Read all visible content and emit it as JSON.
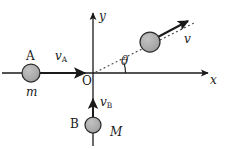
{
  "figure": {
    "type": "physics-vector-diagram",
    "background_color": "#ffffff",
    "line_color": "#1a1a1a",
    "ball_fill_color": "#a8a8a8",
    "ball_stroke_color": "#1a1a1a",
    "dotted_line_color": "#5a5a5a"
  },
  "axes": {
    "x_label": "x",
    "y_label": "y",
    "origin_label": "O"
  },
  "bodies": [
    {
      "id": "A",
      "name_label": "A",
      "mass_label": "m",
      "velocity_label": "v",
      "velocity_subscript": "A",
      "position": {
        "x": 31,
        "y": 73
      },
      "radius": 9,
      "direction": "right"
    },
    {
      "id": "B",
      "name_label": "B",
      "mass_label": "M",
      "velocity_label": "v",
      "velocity_subscript": "B",
      "position": {
        "x": 93,
        "y": 125
      },
      "radius": 8,
      "direction": "up"
    },
    {
      "id": "combined",
      "name_label": "",
      "mass_label": "",
      "velocity_label": "v",
      "velocity_subscript": "",
      "position": {
        "x": 150,
        "y": 42
      },
      "radius": 10,
      "direction": "up-right"
    }
  ],
  "angle": {
    "symbol": "θ",
    "vertex": {
      "x": 93,
      "y": 73
    },
    "measured_from": "positive x-axis",
    "value_degrees": 20
  },
  "labels": {
    "ball_a_name": "A",
    "ball_a_mass": "m",
    "ball_a_velocity": "v",
    "ball_a_velocity_sub": "A",
    "ball_b_name": "B",
    "ball_b_mass": "M",
    "ball_b_velocity": "v",
    "ball_b_velocity_sub": "B",
    "combined_velocity": "v",
    "angle_symbol": "θ",
    "origin": "O",
    "axis_x": "x",
    "axis_y": "y"
  }
}
